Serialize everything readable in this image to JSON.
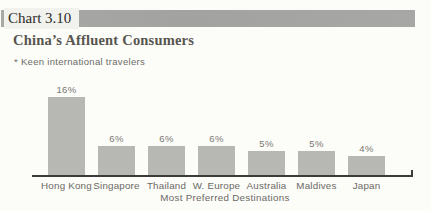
{
  "header": {
    "chart_label": "Chart 3.10",
    "title": "China’s Affluent Consumers"
  },
  "note": "* Keen international travelers",
  "chart_data": {
    "type": "bar",
    "categories": [
      "Hong Kong",
      "Singapore",
      "Thailand",
      "W. Europe",
      "Australia",
      "Maldives",
      "Japan"
    ],
    "values": [
      16,
      6,
      6,
      6,
      5,
      5,
      4
    ],
    "value_labels": [
      "16%",
      "6%",
      "6%",
      "6%",
      "5%",
      "5%",
      "4%"
    ],
    "title": "",
    "xlabel": "Most Preferred Destinations",
    "ylabel": "",
    "ylim": [
      0,
      17
    ],
    "grid": false,
    "legend": false,
    "bar_color": "#b7b7b4"
  },
  "colors": {
    "banner": "#a5a5a3",
    "banner_label_bg": "#f1f1ed",
    "page_bg": "#fcfcf8",
    "axis": "#3c3b38",
    "bar": "#b7b7b4",
    "title_text": "#57554f",
    "muted_text": "#6b6a65"
  }
}
